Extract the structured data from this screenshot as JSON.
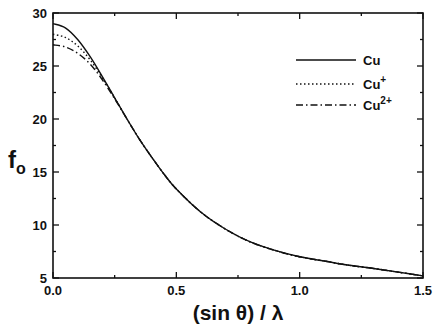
{
  "chart_data": {
    "type": "line",
    "title": "",
    "xlabel": "(sin θ) / λ",
    "ylabel": "f",
    "ylabel_subscript": "o",
    "xlim": [
      0.0,
      1.5
    ],
    "ylim": [
      5,
      30
    ],
    "xticks": [
      "0.0",
      "0.5",
      "1.0",
      "1.5"
    ],
    "yticks": [
      "5",
      "10",
      "15",
      "20",
      "25",
      "30"
    ],
    "grid": false,
    "legend_position": "upper right",
    "series": [
      {
        "name": "Cu",
        "label_base": "Cu",
        "label_sup": "",
        "style": "solid",
        "x": [
          0.0,
          0.05,
          0.1,
          0.15,
          0.2,
          0.25,
          0.3,
          0.35,
          0.4,
          0.45,
          0.5,
          0.6,
          0.7,
          0.8,
          0.9,
          1.0,
          1.1,
          1.2,
          1.3,
          1.4,
          1.5
        ],
        "y": [
          29.0,
          28.6,
          27.5,
          25.9,
          24.0,
          22.0,
          20.0,
          18.1,
          16.4,
          14.8,
          13.4,
          11.2,
          9.6,
          8.4,
          7.6,
          7.0,
          6.6,
          6.2,
          5.9,
          5.55,
          5.2
        ]
      },
      {
        "name": "Cu+",
        "label_base": "Cu",
        "label_sup": "+",
        "style": "dotted",
        "x": [
          0.0,
          0.05,
          0.1,
          0.15,
          0.2,
          0.25,
          0.3,
          0.35,
          0.4,
          0.45,
          0.5,
          0.6,
          0.7,
          0.8,
          0.9,
          1.0,
          1.1,
          1.2,
          1.3,
          1.4,
          1.5
        ],
        "y": [
          28.0,
          27.7,
          26.9,
          25.6,
          23.9,
          22.0,
          20.0,
          18.1,
          16.4,
          14.8,
          13.4,
          11.2,
          9.6,
          8.4,
          7.6,
          7.0,
          6.6,
          6.2,
          5.9,
          5.55,
          5.2
        ]
      },
      {
        "name": "Cu2+",
        "label_base": "Cu",
        "label_sup": "2+",
        "style": "dashdot",
        "x": [
          0.0,
          0.05,
          0.1,
          0.15,
          0.2,
          0.25,
          0.3,
          0.35,
          0.4,
          0.45,
          0.5,
          0.6,
          0.7,
          0.8,
          0.9,
          1.0,
          1.1,
          1.2,
          1.3,
          1.4,
          1.5
        ],
        "y": [
          27.0,
          26.8,
          26.2,
          25.2,
          23.7,
          21.9,
          20.0,
          18.1,
          16.4,
          14.8,
          13.4,
          11.2,
          9.6,
          8.4,
          7.6,
          7.0,
          6.6,
          6.2,
          5.9,
          5.55,
          5.2
        ]
      }
    ]
  }
}
